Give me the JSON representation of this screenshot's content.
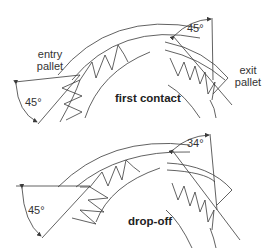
{
  "panels": {
    "first_contact": {
      "title": "first contact",
      "entry": {
        "label_line1": "entry",
        "label_line2": "pallet",
        "angle": "45°"
      },
      "exit": {
        "label_line1": "exit",
        "label_line2": "pallet",
        "angle": "45°"
      }
    },
    "drop_off": {
      "title": "drop-off",
      "entry": {
        "angle": "45°"
      },
      "exit": {
        "angle": "34°"
      }
    }
  },
  "colors": {
    "line": "#3a3a3a",
    "text": "#333333",
    "background": "#ffffff"
  }
}
